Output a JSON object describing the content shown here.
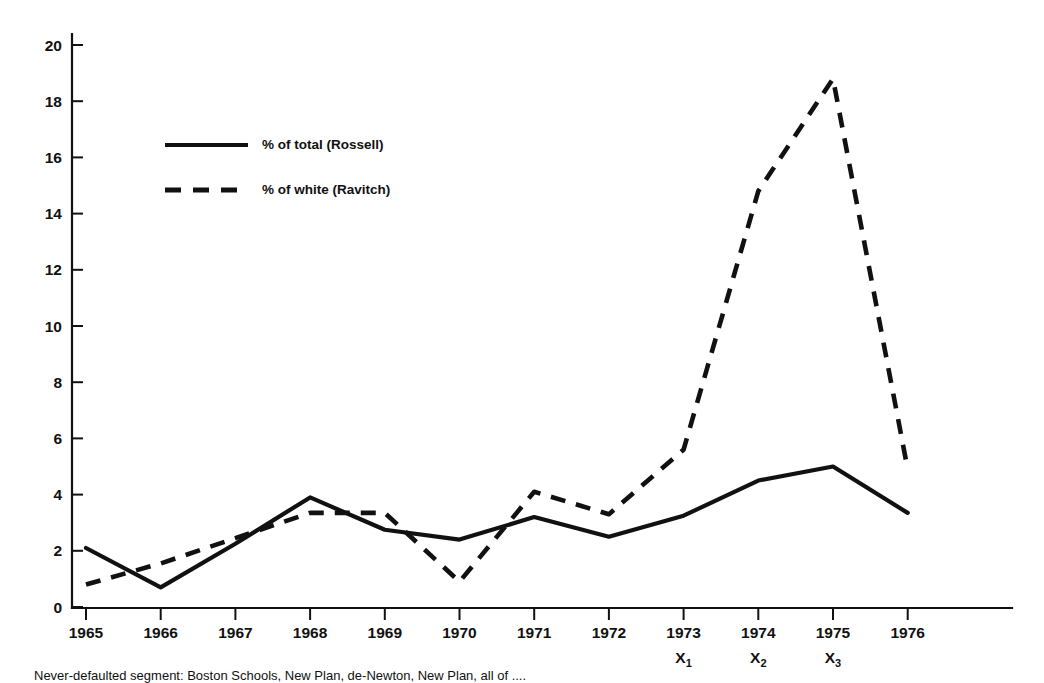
{
  "chart_data": {
    "type": "line",
    "title": "",
    "subtitle": "",
    "xlabel": "",
    "ylabel": "",
    "x": [
      1965,
      1966,
      1967,
      1968,
      1969,
      1970,
      1971,
      1972,
      1973,
      1974,
      1975,
      1976
    ],
    "categories": [
      "1965",
      "1966",
      "1967",
      "1968",
      "1969",
      "1970",
      "1971",
      "1972",
      "1973",
      "1974",
      "1975",
      "1976"
    ],
    "xlim": [
      1965,
      1976
    ],
    "ylim": [
      0,
      20
    ],
    "yticks": [
      0,
      2,
      4,
      6,
      8,
      10,
      12,
      14,
      16,
      18,
      20
    ],
    "ytick_labels": [
      "0",
      "2",
      "4",
      "6",
      "8",
      "10",
      "12",
      "14",
      "16",
      "18",
      "20"
    ],
    "xticks": [
      1965,
      1966,
      1967,
      1968,
      1969,
      1970,
      1971,
      1972,
      1973,
      1974,
      1975,
      1976
    ],
    "xtick_labels": [
      "1965",
      "1966",
      "1967",
      "1968",
      "1969",
      "1970",
      "1971",
      "1972",
      "1973",
      "1974",
      "1975",
      "1976"
    ],
    "grid": false,
    "legend_position": "upper left inside",
    "series": [
      {
        "name": "% of total (Rossell)",
        "style": "solid",
        "color": "#111111",
        "values": [
          2.1,
          0.7,
          2.25,
          3.9,
          2.75,
          2.4,
          3.2,
          2.5,
          3.25,
          4.5,
          5.0,
          3.35
        ]
      },
      {
        "name": "% of white (Ravitch)",
        "style": "dashed",
        "color": "#111111",
        "values": [
          0.8,
          1.55,
          2.45,
          3.35,
          3.35,
          0.9,
          4.1,
          3.3,
          5.6,
          14.8,
          18.8,
          4.9
        ]
      }
    ],
    "annotations": [
      {
        "text": "X",
        "subscript": "1",
        "at_x": 1973
      },
      {
        "text": "X",
        "subscript": "2",
        "at_x": 1974
      },
      {
        "text": "X",
        "subscript": "3",
        "at_x": 1975
      }
    ]
  },
  "legend": {
    "items": [
      {
        "label": "% of total (Rossell)",
        "style": "solid"
      },
      {
        "label": "% of white (Ravitch)",
        "style": "dashed"
      }
    ]
  },
  "caption": {
    "text": "Never-defaulted segment: Boston Schools, New Plan, de-Newton, New Plan, all of ...."
  }
}
